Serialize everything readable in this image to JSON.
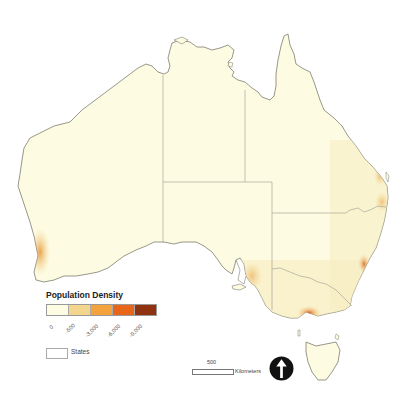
{
  "map": {
    "subject": "Australia",
    "land_color": "#fdfbe2",
    "coast_color": "#7d7d70",
    "border_color": "#a9a89a",
    "hotspots": [
      {
        "name": "Perth",
        "color": "#e9a44c"
      },
      {
        "name": "Adelaide",
        "color": "#eec27b"
      },
      {
        "name": "Melbourne",
        "color": "#d96a2b"
      },
      {
        "name": "Sydney",
        "color": "#e08a3c"
      },
      {
        "name": "Brisbane",
        "color": "#eabf7a"
      }
    ]
  },
  "legend": {
    "title": "Population Density",
    "classes": [
      {
        "label": "0",
        "color": "#fdfbe2"
      },
      {
        "label": "-500",
        "color": "#f3d58e"
      },
      {
        "label": "-3,000",
        "color": "#f4a23c"
      },
      {
        "label": "-6,000",
        "color": "#e8661c"
      },
      {
        "label": "-9,000",
        "color": "#8f3210"
      }
    ],
    "states_label": "States"
  },
  "scale": {
    "value": "500",
    "unit": "Kilometers"
  },
  "north_arrow": "north-arrow-icon"
}
